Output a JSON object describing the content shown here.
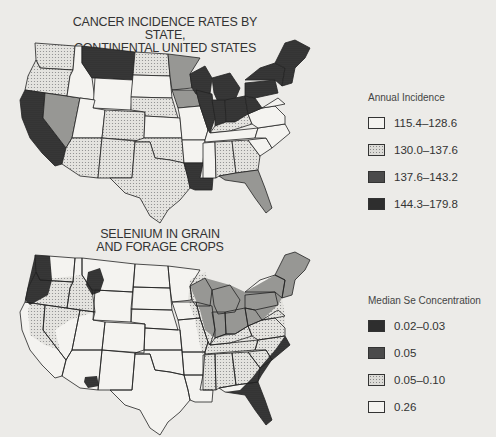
{
  "figure": {
    "map1": {
      "title_lines": [
        "CANCER INCIDENCE RATES BY STATE,",
        "CONTINENTAL UNITED STATES",
        "1959"
      ],
      "legend": {
        "title": "Annual Incidence",
        "items": [
          {
            "label": "115.4–128.6",
            "fill": "white"
          },
          {
            "label": "130.0–137.6",
            "fill": "light"
          },
          {
            "label": "137.6–143.2",
            "fill": "medium"
          },
          {
            "label": "144.3–179.8",
            "fill": "dark"
          }
        ]
      },
      "states": {
        "WA": "light",
        "OR": "light",
        "CA": "dark",
        "NV": "medium",
        "ID": "white",
        "MT": "dark",
        "WY": "white",
        "UT": "white",
        "CO": "light",
        "AZ": "light",
        "NM": "light",
        "ND": "light",
        "SD": "white",
        "NE": "light",
        "KS": "white",
        "OK": "light",
        "TX": "light",
        "MN": "medium",
        "IA": "medium",
        "MO": "white",
        "AR": "white",
        "LA": "dark",
        "WI": "dark",
        "IL": "dark",
        "MI": "dark",
        "IN": "dark",
        "OH": "dark",
        "KY": "light",
        "TN": "white",
        "MS": "white",
        "AL": "light",
        "GA": "light",
        "FL": "medium",
        "SC": "white",
        "NC": "white",
        "VA": "white",
        "WV": "dark",
        "PA": "dark",
        "NY": "dark",
        "NE_REGION": "dark",
        "MD": "white"
      }
    },
    "map2": {
      "title_lines": [
        "SELENIUM IN GRAIN",
        "AND FORAGE CROPS"
      ],
      "legend": {
        "title": "Median Se Concentration",
        "items": [
          {
            "label": "0.02–0.03",
            "fill": "dark"
          },
          {
            "label": "0.05",
            "fill": "medium"
          },
          {
            "label": "0.05–0.10",
            "fill": "light"
          },
          {
            "label": "0.26",
            "fill": "white"
          }
        ]
      }
    }
  }
}
